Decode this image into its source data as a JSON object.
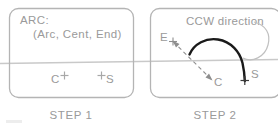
{
  "figure": {
    "background": "#ffffff",
    "line_color": "#b4b4b4",
    "text_color": "#9a9a9a",
    "arc_color": "#1a1a1a",
    "dash_color": "#8e8e8e",
    "scan_line_color": "#c9c9c9"
  },
  "panels": [
    {
      "id": "step-1",
      "caption": "STEP  1",
      "command_label": "ARC:",
      "command_args": "(Arc, Cent, End)",
      "points": [
        {
          "name": "center-point",
          "label": "C",
          "marker": "+"
        },
        {
          "name": "start-point",
          "label": "S",
          "marker": "+"
        }
      ]
    },
    {
      "id": "step-2",
      "caption": "STEP  2",
      "annotation": "CCW  direction",
      "points": [
        {
          "name": "end-point",
          "label": "E",
          "marker": "+"
        },
        {
          "name": "center-point",
          "label": "C",
          "marker": "+"
        },
        {
          "name": "start-point",
          "label": "S",
          "marker": "+"
        }
      ]
    }
  ]
}
